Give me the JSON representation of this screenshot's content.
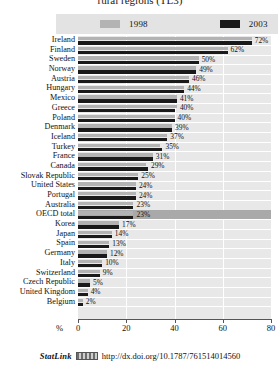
{
  "chart_title": "rural regions (TL3)",
  "legend": {
    "entries": [
      {
        "label": "1998",
        "color": "#b3b3b3"
      },
      {
        "label": "2003",
        "color": "#1a1a1a"
      }
    ]
  },
  "axis": {
    "unit_label": "%",
    "ticks": [
      "0",
      "20",
      "40",
      "60",
      "80"
    ],
    "min": 0,
    "max": 80
  },
  "footer": {
    "statlink_word": "StatLink",
    "icon_name": "statlink-icon",
    "url": "http://dx.doi.org/10.1787/761514014560"
  },
  "chart_data": {
    "type": "bar",
    "orientation": "horizontal",
    "title": "rural regions (TL3)",
    "xlabel": "%",
    "ylabel": "",
    "xlim": [
      0,
      80
    ],
    "grid": true,
    "legend_position": "top",
    "categories": [
      "Ireland",
      "Finland",
      "Sweden",
      "Norway",
      "Austria",
      "Hungary",
      "Mexico",
      "Greece",
      "Poland",
      "Denmark",
      "Iceland",
      "Turkey",
      "France",
      "Canada",
      "Slovak Republic",
      "United States",
      "Portugal",
      "Australia",
      "OECD total",
      "Korea",
      "Japan",
      "Spain",
      "Germany",
      "Italy",
      "Switzerland",
      "Czech Republic",
      "United Kingdom",
      "Belgium"
    ],
    "highlight_category": "OECD total",
    "series": [
      {
        "name": "1998",
        "color": "#b3b3b3",
        "values": [
          72,
          62,
          50,
          49,
          46,
          44,
          41,
          41,
          40,
          39,
          37,
          34,
          31,
          28,
          25,
          24,
          24,
          23,
          23,
          17,
          14,
          13,
          12,
          10,
          9,
          5,
          4,
          2
        ]
      },
      {
        "name": "2003",
        "color": "#1a1a1a",
        "values": [
          72,
          62,
          50,
          49,
          46,
          44,
          41,
          40,
          40,
          39,
          37,
          35,
          31,
          29,
          25,
          24,
          24,
          23,
          23,
          17,
          14,
          13,
          12,
          10,
          9,
          5,
          4,
          2
        ]
      }
    ],
    "value_labels": [
      "72%",
      "62%",
      "50%",
      "49%",
      "46%",
      "44%",
      "41%",
      "40%",
      "40%",
      "39%",
      "37%",
      "35%",
      "31%",
      "29%",
      "25%",
      "24%",
      "24%",
      "23%",
      "23%",
      "17%",
      "14%",
      "13%",
      "12%",
      "10%",
      "9%",
      "5%",
      "4%",
      "2%"
    ]
  }
}
